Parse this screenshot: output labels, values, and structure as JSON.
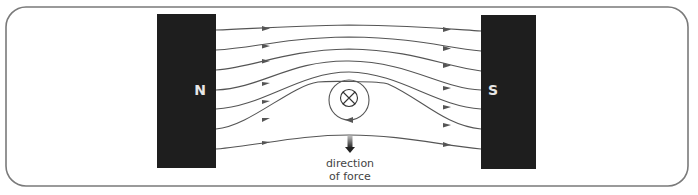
{
  "diagram": {
    "frame": {
      "x": 6,
      "y": 7,
      "width": 682,
      "height": 179,
      "radius": 20,
      "stroke": "#7a7a7a"
    },
    "magnets": [
      {
        "id": "north",
        "label": "N",
        "x": 157,
        "y": 14,
        "width": 59,
        "height": 154,
        "color": "#1e1e1e"
      },
      {
        "id": "south",
        "label": "S",
        "x": 481,
        "y": 15,
        "width": 55,
        "height": 154,
        "color": "#1e1e1e"
      }
    ],
    "wire": {
      "symbol": "cross",
      "meaning": "current into page",
      "cx": 349,
      "cy": 100,
      "inner_r": 9,
      "loop_r": 20
    },
    "field_lines": {
      "count": 7,
      "direction": "N to S",
      "color": "#555555"
    },
    "force_arrow": {
      "x": 350,
      "y1": 136,
      "y2": 152,
      "direction": "down",
      "color": "#333333"
    },
    "caption": {
      "line1": "direction",
      "line2": "of force"
    }
  }
}
